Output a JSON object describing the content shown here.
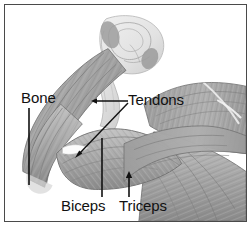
{
  "figure": {
    "kind": "anatomical-illustration",
    "style": "grayscale line and tone drawing",
    "border_color": "#4a4a4a",
    "background_color": "#ffffff",
    "label_color": "#111111",
    "leader_color": "#111111"
  },
  "labels": {
    "bone": "Bone",
    "tendons": "Tendons",
    "biceps": "Biceps",
    "triceps": "Triceps"
  },
  "leaders": [
    {
      "name": "bone-leader",
      "label": "Bone",
      "type": "vertical-line",
      "from": [
        24,
        103
      ],
      "to": [
        24,
        180
      ]
    },
    {
      "name": "tendons-leader-upper",
      "label": "Tendons",
      "type": "horizontal-line-with-arrow",
      "from": [
        123,
        96
      ],
      "to": [
        87,
        96
      ]
    },
    {
      "name": "tendons-leader-lower",
      "label": "Tendons",
      "type": "diagonal-line-with-arrow",
      "from": [
        123,
        97
      ],
      "to": [
        70,
        152
      ]
    },
    {
      "name": "biceps-leader",
      "label": "Biceps",
      "type": "vertical-line",
      "from": [
        97,
        192
      ],
      "to": [
        97,
        133
      ]
    },
    {
      "name": "triceps-leader",
      "label": "Triceps",
      "type": "vertical-line-with-arrow",
      "from": [
        124,
        192
      ],
      "to": [
        124,
        168
      ]
    }
  ],
  "anatomy_parts": [
    {
      "name": "humerus-bone-head",
      "tone": "light-gray",
      "region": "upper-center"
    },
    {
      "name": "upper-arm-bone-shaft",
      "tone": "mid-gray",
      "region": "upper-left-diagonal"
    },
    {
      "name": "tendon-upper",
      "tone": "pale-gray",
      "region": "mid-center"
    },
    {
      "name": "tendon-lower",
      "tone": "white-highlight",
      "region": "mid-left"
    },
    {
      "name": "biceps-muscle-belly",
      "tone": "mid-gray-striated",
      "region": "center"
    },
    {
      "name": "triceps-muscle-belly",
      "tone": "mid-gray-striated",
      "region": "center-right"
    },
    {
      "name": "forearm-muscle-group",
      "tone": "mid-gray-striated",
      "region": "left"
    },
    {
      "name": "deltoid-shoulder-muscle",
      "tone": "mid-gray-striated",
      "region": "right"
    },
    {
      "name": "chest-muscle-group",
      "tone": "mid-gray-striated",
      "region": "lower-right"
    }
  ]
}
